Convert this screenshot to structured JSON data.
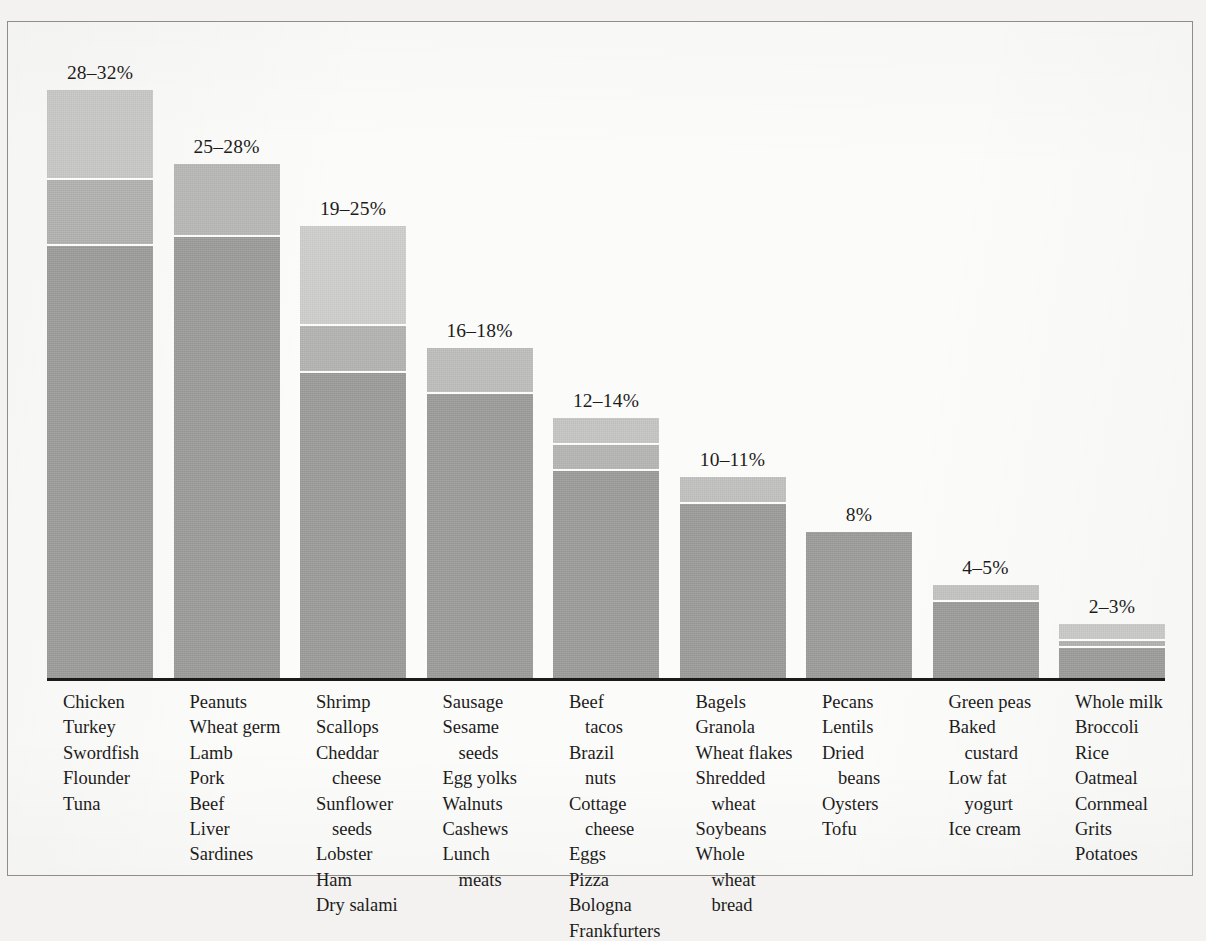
{
  "figure": {
    "axis_baseline": "solid-rule",
    "frame": "thin-gray-rectangle"
  },
  "chart_data": {
    "type": "bar",
    "title": "",
    "subtitle": "",
    "xlabel": "",
    "ylabel": "",
    "grid": false,
    "legend": null,
    "value_unit": "percent",
    "ylim": [
      0,
      32
    ],
    "categories": [
      "28-32%",
      "25-28%",
      "19-25%",
      "16-18%",
      "12-14%",
      "10-11%",
      "8%",
      "4-5%",
      "2-3%"
    ],
    "value_labels": [
      "28–32%",
      "25–28%",
      "19–25%",
      "16–18%",
      "12–14%",
      "10–11%",
      "8%",
      "4–5%",
      "2–3%"
    ],
    "values": [
      32,
      28,
      25,
      18,
      14,
      11,
      8,
      5,
      3
    ],
    "value_low": [
      28,
      25,
      19,
      16,
      12,
      10,
      8,
      4,
      2
    ],
    "value_high": [
      32,
      28,
      25,
      18,
      14,
      11,
      8,
      5,
      3
    ],
    "bars": [
      {
        "label": "28–32%",
        "low": 28,
        "high": 32,
        "segments": [
          {
            "value": 23.5,
            "color": "#9a9a98"
          },
          {
            "value": 3.6,
            "color": "#b0b0ae"
          },
          {
            "value": 4.9,
            "color": "#c6c6c4"
          }
        ],
        "foods": [
          {
            "text": "Chicken",
            "indent": false
          },
          {
            "text": "Turkey",
            "indent": false
          },
          {
            "text": "Swordfish",
            "indent": false
          },
          {
            "text": "Flounder",
            "indent": false
          },
          {
            "text": "Tuna",
            "indent": false
          }
        ]
      },
      {
        "label": "25–28%",
        "low": 25,
        "high": 28,
        "segments": [
          {
            "value": 24.0,
            "color": "#9a9a98"
          },
          {
            "value": 4.0,
            "color": "#b6b6b4"
          }
        ],
        "foods": [
          {
            "text": "Peanuts",
            "indent": false
          },
          {
            "text": "Wheat germ",
            "indent": false
          },
          {
            "text": "Lamb",
            "indent": false
          },
          {
            "text": "Pork",
            "indent": false
          },
          {
            "text": "Beef",
            "indent": false
          },
          {
            "text": "Liver",
            "indent": false
          },
          {
            "text": "Sardines",
            "indent": false
          }
        ]
      },
      {
        "label": "19–25%",
        "low": 19,
        "high": 25,
        "segments": [
          {
            "value": 16.6,
            "color": "#9a9a98"
          },
          {
            "value": 2.6,
            "color": "#b2b2b0"
          },
          {
            "value": 5.4,
            "color": "#cdcdcb"
          }
        ],
        "foods": [
          {
            "text": "Shrimp",
            "indent": false
          },
          {
            "text": "Scallops",
            "indent": false
          },
          {
            "text": "Cheddar",
            "indent": false
          },
          {
            "text": "cheese",
            "indent": true
          },
          {
            "text": "Sunflower",
            "indent": false
          },
          {
            "text": "seeds",
            "indent": true
          },
          {
            "text": "Lobster",
            "indent": false
          },
          {
            "text": "Ham",
            "indent": false
          },
          {
            "text": "Dry salami",
            "indent": false
          }
        ]
      },
      {
        "label": "16–18%",
        "low": 16,
        "high": 18,
        "segments": [
          {
            "value": 15.5,
            "color": "#9a9a98"
          },
          {
            "value": 2.5,
            "color": "#bcbcba"
          }
        ],
        "foods": [
          {
            "text": "Sausage",
            "indent": false
          },
          {
            "text": "Sesame",
            "indent": false
          },
          {
            "text": "seeds",
            "indent": true
          },
          {
            "text": "Egg yolks",
            "indent": false
          },
          {
            "text": "Walnuts",
            "indent": false
          },
          {
            "text": "Cashews",
            "indent": false
          },
          {
            "text": "Lunch",
            "indent": false
          },
          {
            "text": "meats",
            "indent": true
          }
        ]
      },
      {
        "label": "12–14%",
        "low": 12,
        "high": 14,
        "segments": [
          {
            "value": 11.3,
            "color": "#9a9a98"
          },
          {
            "value": 1.4,
            "color": "#b4b4b2"
          },
          {
            "value": 1.5,
            "color": "#c4c4c2"
          }
        ],
        "foods": [
          {
            "text": "Beef",
            "indent": false
          },
          {
            "text": "tacos",
            "indent": true
          },
          {
            "text": "Brazil",
            "indent": false
          },
          {
            "text": "nuts",
            "indent": true
          },
          {
            "text": "Cottage",
            "indent": false
          },
          {
            "text": "cheese",
            "indent": true
          },
          {
            "text": "Eggs",
            "indent": false
          },
          {
            "text": "Pizza",
            "indent": false
          },
          {
            "text": "Bologna",
            "indent": false
          },
          {
            "text": "Frankfurters",
            "indent": false
          }
        ]
      },
      {
        "label": "10–11%",
        "low": 10,
        "high": 11,
        "segments": [
          {
            "value": 9.5,
            "color": "#9a9a98"
          },
          {
            "value": 1.5,
            "color": "#c0c0be"
          }
        ],
        "foods": [
          {
            "text": "Bagels",
            "indent": false
          },
          {
            "text": "Granola",
            "indent": false
          },
          {
            "text": "Wheat flakes",
            "indent": false
          },
          {
            "text": "Shredded",
            "indent": false
          },
          {
            "text": "wheat",
            "indent": true
          },
          {
            "text": "Soybeans",
            "indent": false
          },
          {
            "text": "Whole",
            "indent": false
          },
          {
            "text": "wheat",
            "indent": true
          },
          {
            "text": "bread",
            "indent": true
          }
        ]
      },
      {
        "label": "8%",
        "low": 8,
        "high": 8,
        "segments": [
          {
            "value": 8.0,
            "color": "#9a9a98"
          }
        ],
        "foods": [
          {
            "text": "Pecans",
            "indent": false
          },
          {
            "text": "Lentils",
            "indent": false
          },
          {
            "text": "Dried",
            "indent": false
          },
          {
            "text": "beans",
            "indent": true
          },
          {
            "text": "Oysters",
            "indent": false
          },
          {
            "text": "Tofu",
            "indent": false
          }
        ]
      },
      {
        "label": "4–5%",
        "low": 4,
        "high": 5,
        "segments": [
          {
            "value": 4.2,
            "color": "#9a9a98"
          },
          {
            "value": 0.9,
            "color": "#c2c2c0"
          }
        ],
        "foods": [
          {
            "text": "Green peas",
            "indent": false
          },
          {
            "text": "Baked",
            "indent": false
          },
          {
            "text": "custard",
            "indent": true
          },
          {
            "text": "Low fat",
            "indent": false
          },
          {
            "text": "yogurt",
            "indent": true
          },
          {
            "text": "Ice cream",
            "indent": false
          }
        ]
      },
      {
        "label": "2–3%",
        "low": 2,
        "high": 3,
        "segments": [
          {
            "value": 1.7,
            "color": "#9a9a98"
          },
          {
            "value": 0.35,
            "color": "#b0b0ae"
          },
          {
            "value": 0.95,
            "color": "#c8c8c6"
          }
        ],
        "foods": [
          {
            "text": "Whole milk",
            "indent": false
          },
          {
            "text": "Broccoli",
            "indent": false
          },
          {
            "text": "Rice",
            "indent": false
          },
          {
            "text": "Oatmeal",
            "indent": false
          },
          {
            "text": "Cornmeal",
            "indent": false
          },
          {
            "text": "Grits",
            "indent": false
          },
          {
            "text": "Potatoes",
            "indent": false
          }
        ]
      }
    ]
  }
}
